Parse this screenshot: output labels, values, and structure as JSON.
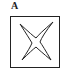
{
  "figure": {
    "label": "A",
    "shape": "four-pointed-star-in-square",
    "stroke_color": "#222222",
    "background": "#ffffff"
  }
}
